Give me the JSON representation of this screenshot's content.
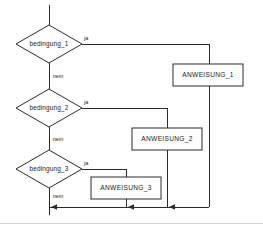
{
  "diagram": {
    "type": "flowchart",
    "language": "de",
    "title": "",
    "decisions": [
      {
        "id": "bedingung_1",
        "label": "bedingung_1",
        "yes_label": "ja",
        "no_label": "nein"
      },
      {
        "id": "bedingung_2",
        "label": "bedingung_2",
        "yes_label": "ja",
        "no_label": "nein"
      },
      {
        "id": "bedingung_3",
        "label": "bedingung_3",
        "yes_label": "ja",
        "no_label": "nein"
      }
    ],
    "processes": [
      {
        "id": "anweisung_1",
        "label": "ANWEISUNG_1"
      },
      {
        "id": "anweisung_2",
        "label": "ANWEISUNG_2"
      },
      {
        "id": "anweisung_3",
        "label": "ANWEISUNG_3"
      }
    ],
    "colors": {
      "stroke": "#2a2a2a",
      "fill": "#ffffff",
      "background": "#ffffff",
      "footer_rule": "#b7d9e8"
    }
  }
}
